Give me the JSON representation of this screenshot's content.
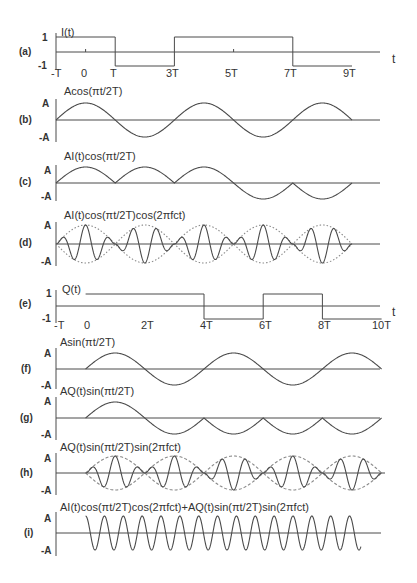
{
  "figure": {
    "colors": {
      "line": "#4a4a4a",
      "envelope": "#8a8a8a",
      "text": "#333333",
      "background": "#ffffff"
    },
    "time_axis": {
      "a_ticks": [
        "-T",
        "0",
        "T",
        "3T",
        "5T",
        "7T",
        "9T"
      ],
      "e_ticks": [
        "-T",
        "0",
        "2T",
        "4T",
        "6T",
        "8T",
        "10T"
      ],
      "axis_label": "t"
    },
    "panels": [
      {
        "id": "a",
        "tag": "(a)",
        "title": "I(t)",
        "y_top": "1",
        "y_bot": "-1"
      },
      {
        "id": "b",
        "tag": "(b)",
        "title": "Acos(πt/2T)",
        "y_top": "A",
        "y_bot": "-A"
      },
      {
        "id": "c",
        "tag": "(c)",
        "title": "AI(t)cos(πt/2T)",
        "y_top": "A",
        "y_bot": "-A"
      },
      {
        "id": "d",
        "tag": "(d)",
        "title": "AI(t)cos(πt/2T)cos(2πfct)",
        "y_top": "A",
        "y_bot": "-A"
      },
      {
        "id": "e",
        "tag": "(e)",
        "title": "Q(t)",
        "y_top": "1",
        "y_bot": "-1"
      },
      {
        "id": "f",
        "tag": "(f)",
        "title": "Asin(πt/2T)",
        "y_top": "A",
        "y_bot": "-A"
      },
      {
        "id": "g",
        "tag": "(g)",
        "title": "AQ(t)sin(πt/2T)",
        "y_top": "A",
        "y_bot": "-A"
      },
      {
        "id": "h",
        "tag": "(h)",
        "title": "AQ(t)sin(πt/2T)sin(2πfct)",
        "y_top": "A",
        "y_bot": "-A"
      },
      {
        "id": "i",
        "tag": "(i)",
        "title": "AI(t)cos(πt/2T)cos(2πfct)+AQ(t)sin(πt/2T)sin(2πfct)",
        "y_top": "A",
        "y_bot": "-A"
      }
    ]
  },
  "chart_data": {
    "type": "line",
    "xlabel": "t",
    "series": [
      {
        "name": "I(t)",
        "kind": "step",
        "x_units": "T",
        "segments": [
          [
            -1,
            1,
            1
          ],
          [
            1,
            3,
            -1
          ],
          [
            3,
            7,
            1
          ],
          [
            7,
            9,
            -1
          ]
        ]
      },
      {
        "name": "Acos(πt/2T)",
        "kind": "cosine",
        "x_range": [
          -1,
          9
        ]
      },
      {
        "name": "AI(t)cos(πt/2T)",
        "kind": "product",
        "x_range": [
          -1,
          9
        ]
      },
      {
        "name": "AI(t)cos(πt/2T)cos(2πfct)",
        "kind": "modulated",
        "x_range": [
          -1,
          9
        ],
        "envelope": "dotted"
      },
      {
        "name": "Q(t)",
        "kind": "step",
        "x_units": "T",
        "segments": [
          [
            0,
            4,
            1
          ],
          [
            4,
            6,
            -1
          ],
          [
            6,
            8,
            1
          ],
          [
            8,
            10,
            -1
          ]
        ]
      },
      {
        "name": "Asin(πt/2T)",
        "kind": "sine",
        "x_range": [
          0,
          10
        ]
      },
      {
        "name": "AQ(t)sin(πt/2T)",
        "kind": "product",
        "x_range": [
          0,
          10
        ]
      },
      {
        "name": "AQ(t)sin(πt/2T)sin(2πfct)",
        "kind": "modulated",
        "x_range": [
          0,
          10
        ],
        "envelope": "dashed"
      },
      {
        "name": "MSK sum",
        "kind": "constant-envelope FM",
        "x_range": [
          0,
          9
        ]
      }
    ],
    "y_ticks": [
      "A",
      "-A"
    ],
    "grid": false
  }
}
